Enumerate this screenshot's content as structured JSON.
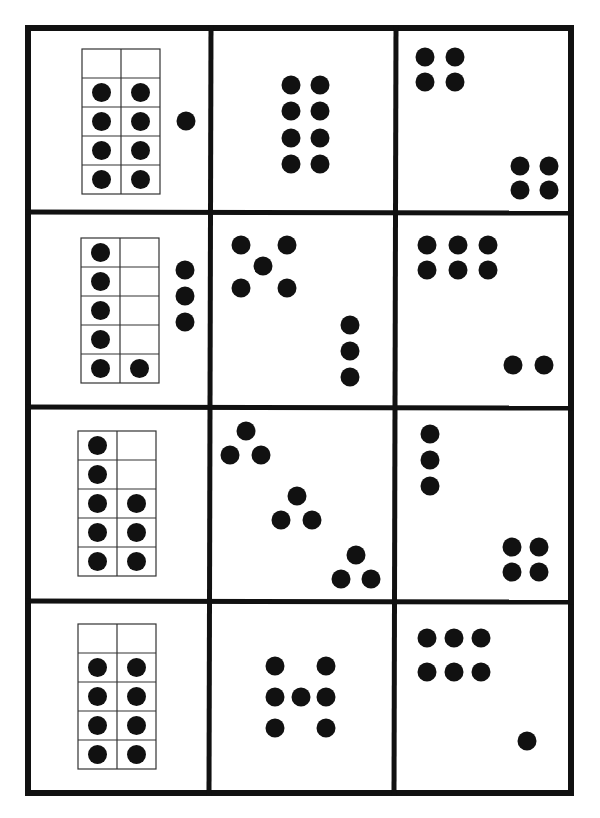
{
  "sheet": {
    "ink_color": "#111111",
    "paper_color": "#ffffff",
    "frame_line_color": "#333333",
    "outer_border": {
      "x": 25,
      "y": 25,
      "w": 549,
      "h": 771,
      "stroke": 6
    },
    "vertical_dividers": [
      {
        "x1": 211,
        "y1": 25,
        "x2": 209,
        "y2": 796,
        "stroke": 5
      },
      {
        "x1": 396,
        "y1": 25,
        "x2": 394,
        "y2": 796,
        "stroke": 5
      }
    ],
    "horizontal_dividers": [
      {
        "x1": 25,
        "y1": 212,
        "x2": 574,
        "y2": 213,
        "stroke": 5
      },
      {
        "x1": 25,
        "y1": 407,
        "x2": 574,
        "y2": 408,
        "stroke": 5
      },
      {
        "x1": 25,
        "y1": 601,
        "x2": 574,
        "y2": 602,
        "stroke": 5
      }
    ],
    "dot_radius": 9.5
  },
  "rows": [
    {
      "row": 1,
      "cells": [
        {
          "type": "ten-frame",
          "count": 9,
          "frame": {
            "x": 82,
            "y": 49,
            "cols": 2,
            "rows": 5,
            "cell_w": 39,
            "cell_h": 29
          },
          "filled": [
            [
              1,
              0
            ],
            [
              1,
              1
            ],
            [
              2,
              0
            ],
            [
              2,
              1
            ],
            [
              3,
              0
            ],
            [
              3,
              1
            ],
            [
              4,
              0
            ],
            [
              4,
              1
            ]
          ],
          "extra_dots": [
            [
              186,
              121
            ]
          ]
        },
        {
          "type": "dot-pattern",
          "count": 8,
          "dots": [
            [
              291,
              85
            ],
            [
              320,
              85
            ],
            [
              291,
              111
            ],
            [
              320,
              111
            ],
            [
              291,
              138
            ],
            [
              320,
              138
            ],
            [
              291,
              164
            ],
            [
              320,
              164
            ]
          ]
        },
        {
          "type": "dot-pattern",
          "count": 8,
          "dots": [
            [
              425,
              57
            ],
            [
              455,
              57
            ],
            [
              425,
              82
            ],
            [
              455,
              82
            ],
            [
              520,
              166
            ],
            [
              549,
              166
            ],
            [
              520,
              190
            ],
            [
              549,
              190
            ]
          ]
        }
      ]
    },
    {
      "row": 2,
      "cells": [
        {
          "type": "ten-frame",
          "count": 9,
          "frame": {
            "x": 81,
            "y": 238,
            "cols": 2,
            "rows": 5,
            "cell_w": 39,
            "cell_h": 29
          },
          "filled": [
            [
              0,
              0
            ],
            [
              1,
              0
            ],
            [
              2,
              0
            ],
            [
              3,
              0
            ],
            [
              4,
              0
            ],
            [
              4,
              1
            ]
          ],
          "extra_dots": [
            [
              185,
              270
            ],
            [
              185,
              296
            ],
            [
              185,
              322
            ]
          ]
        },
        {
          "type": "dot-pattern",
          "count": 8,
          "dots": [
            [
              241,
              245
            ],
            [
              287,
              245
            ],
            [
              263,
              266
            ],
            [
              241,
              288
            ],
            [
              287,
              288
            ],
            [
              350,
              325
            ],
            [
              350,
              351
            ],
            [
              350,
              377
            ]
          ]
        },
        {
          "type": "dot-pattern",
          "count": 8,
          "dots": [
            [
              427,
              245
            ],
            [
              458,
              245
            ],
            [
              488,
              245
            ],
            [
              427,
              270
            ],
            [
              458,
              270
            ],
            [
              488,
              270
            ],
            [
              513,
              365
            ],
            [
              544,
              365
            ]
          ]
        }
      ]
    },
    {
      "row": 3,
      "cells": [
        {
          "type": "ten-frame",
          "count": 8,
          "frame": {
            "x": 78,
            "y": 431,
            "cols": 2,
            "rows": 5,
            "cell_w": 39,
            "cell_h": 29
          },
          "filled": [
            [
              0,
              0
            ],
            [
              1,
              0
            ],
            [
              2,
              0
            ],
            [
              2,
              1
            ],
            [
              3,
              0
            ],
            [
              3,
              1
            ],
            [
              4,
              0
            ],
            [
              4,
              1
            ]
          ],
          "extra_dots": []
        },
        {
          "type": "dot-pattern",
          "count": 9,
          "dots": [
            [
              246,
              431
            ],
            [
              230,
              455
            ],
            [
              261,
              455
            ],
            [
              297,
              496
            ],
            [
              281,
              520
            ],
            [
              312,
              520
            ],
            [
              356,
              555
            ],
            [
              341,
              579
            ],
            [
              371,
              579
            ]
          ]
        },
        {
          "type": "dot-pattern",
          "count": 7,
          "dots": [
            [
              430,
              434
            ],
            [
              430,
              460
            ],
            [
              430,
              486
            ],
            [
              512,
              547
            ],
            [
              539,
              547
            ],
            [
              512,
              572
            ],
            [
              539,
              572
            ]
          ]
        }
      ]
    },
    {
      "row": 4,
      "cells": [
        {
          "type": "ten-frame",
          "count": 8,
          "frame": {
            "x": 78,
            "y": 624,
            "cols": 2,
            "rows": 5,
            "cell_w": 39,
            "cell_h": 29
          },
          "filled": [
            [
              1,
              0
            ],
            [
              1,
              1
            ],
            [
              2,
              0
            ],
            [
              2,
              1
            ],
            [
              3,
              0
            ],
            [
              3,
              1
            ],
            [
              4,
              0
            ],
            [
              4,
              1
            ]
          ],
          "extra_dots": []
        },
        {
          "type": "dot-pattern",
          "count": 7,
          "dots": [
            [
              275,
              666
            ],
            [
              326,
              666
            ],
            [
              275,
              697
            ],
            [
              301,
              697
            ],
            [
              326,
              697
            ],
            [
              275,
              728
            ],
            [
              326,
              728
            ]
          ]
        },
        {
          "type": "dot-pattern",
          "count": 7,
          "dots": [
            [
              427,
              638
            ],
            [
              454,
              638
            ],
            [
              481,
              638
            ],
            [
              427,
              672
            ],
            [
              454,
              672
            ],
            [
              481,
              672
            ],
            [
              527,
              741
            ]
          ]
        }
      ]
    }
  ],
  "cell_bounds": [
    [
      [
        31,
        31,
        178,
        179
      ],
      [
        214,
        31,
        179,
        179
      ],
      [
        399,
        31,
        172,
        179
      ]
    ],
    [
      [
        31,
        216,
        178,
        189
      ],
      [
        213,
        216,
        180,
        189
      ],
      [
        398,
        216,
        173,
        189
      ]
    ],
    [
      [
        31,
        411,
        178,
        188
      ],
      [
        212,
        411,
        180,
        188
      ],
      [
        397,
        411,
        174,
        188
      ]
    ],
    [
      [
        31,
        605,
        176,
        188
      ],
      [
        211,
        605,
        181,
        188
      ],
      [
        396,
        605,
        175,
        188
      ]
    ]
  ]
}
